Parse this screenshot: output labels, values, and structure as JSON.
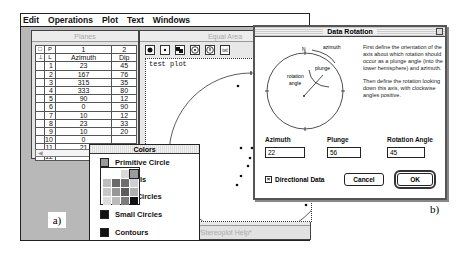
{
  "menubar": {
    "items": [
      "Edit",
      "Operations",
      "Plot",
      "Text",
      "Windows"
    ]
  },
  "planes": {
    "title": "Planes",
    "header1": [
      "P",
      "1",
      "2"
    ],
    "header2": [
      "L",
      "Azimuth",
      "Dip"
    ],
    "rows": [
      [
        "1",
        "23",
        "45"
      ],
      [
        "2",
        "167",
        "76"
      ],
      [
        "3",
        "315",
        "35"
      ],
      [
        "4",
        "333",
        "80"
      ],
      [
        "5",
        "90",
        "12"
      ],
      [
        "6",
        "0",
        "90"
      ],
      [
        "7",
        "10",
        "12"
      ],
      [
        "8",
        "23",
        "33"
      ],
      [
        "9",
        "10",
        "20"
      ],
      [
        "10",
        "0",
        ""
      ],
      [
        "11",
        "21",
        ""
      ],
      [
        "12",
        "",
        ""
      ]
    ]
  },
  "equal_area": {
    "title": "Equal Area",
    "toolbar": [
      "filled-dot-icon",
      "small-dot-icon",
      "squares-icon",
      "target-icon",
      "target-info-icon",
      "text-tool-icon"
    ],
    "plot_title": "test plot",
    "footer": "*Stereoplot Help*"
  },
  "label_a": "a)",
  "label_b": "b)",
  "colors": {
    "title": "Colors",
    "items": [
      {
        "label": "Primitive Circle",
        "color": "#9a9a9a"
      },
      {
        "label": "Symbols",
        "color": "#8a8a8a"
      },
      {
        "label": "Great Circles",
        "color": "#555555"
      },
      {
        "label": "Small Circles",
        "color": "#111111"
      },
      {
        "label": "Contours",
        "color": "#111111"
      }
    ],
    "grid": [
      "#ffffff",
      "#ffffff",
      "#d8d8d8",
      "#9c9c9c",
      "#bdbdbd",
      "#6a6a6a",
      "#6e6e6e",
      "#d0d0d0",
      "#c7c7c7",
      "#969696",
      "#5c5c5c",
      "#b0b0b0",
      "#dcdcdc",
      "#bbbbbb",
      "#7c7c7c",
      "#111111"
    ]
  },
  "dialog": {
    "title": "Data Rotation",
    "diagram": {
      "north": "N",
      "azimuth": "azimuth",
      "plunge": "plunge",
      "rotation": "rotation",
      "angle": "angle"
    },
    "description1": "First define the orientation of the axis about which rotation should occur as a plunge angle (into the lower hemisphere) and azimuth.",
    "description2": "Then define the rotation looking down this axis, with clockwise angles positive.",
    "azimuth_label": "Azimuth",
    "azimuth_value": "22",
    "plunge_label": "Plunge",
    "plunge_value": "56",
    "rotation_label": "Rotation Angle",
    "rotation_value": "45",
    "directional_label": "Directional Data",
    "directional_checked": "×",
    "cancel_label": "Cancel",
    "ok_label": "OK"
  }
}
